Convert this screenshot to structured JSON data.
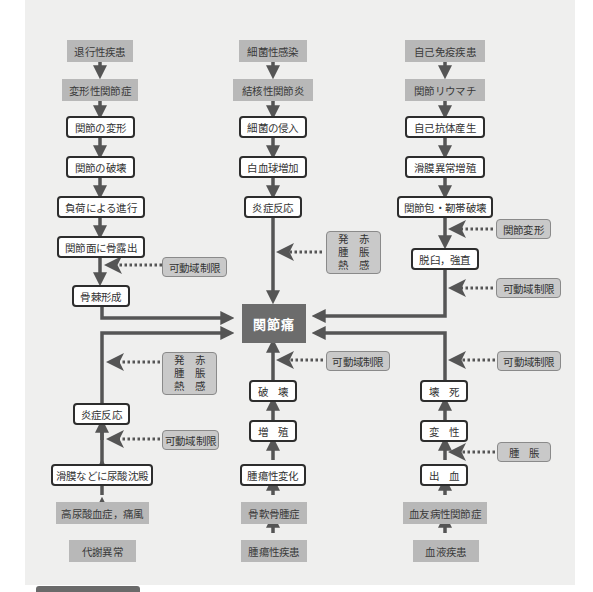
{
  "diagram": {
    "center": "関節痛",
    "columns": {
      "top_left": {
        "source": [
          "退行性疾患",
          "変形性関節症"
        ],
        "steps": [
          "関節の変形",
          "関節の破壊",
          "負荷による進行",
          "関節面に骨露出",
          "骨棘形成"
        ],
        "notes": [
          "可動域制限"
        ]
      },
      "top_center": {
        "source": [
          "細菌性感染",
          "結核性関節炎"
        ],
        "steps": [
          "細菌の侵入",
          "白血球増加",
          "炎症反応"
        ],
        "notes": [
          "発　赤\n腫　脹\n熱　感"
        ]
      },
      "top_right": {
        "source": [
          "自己免疫疾患",
          "関節リウマチ"
        ],
        "steps": [
          "自己抗体産生",
          "滑膜異常増殖",
          "関節包・靭帯破壊",
          "脱臼，強直"
        ],
        "notes": [
          "関節変形",
          "可動域制限"
        ]
      },
      "bottom_left": {
        "source": [
          "代謝異常",
          "高尿酸血症，痛風"
        ],
        "steps": [
          "滑膜などに尿酸沈殿",
          "炎症反応"
        ],
        "notes": [
          "可動域制限",
          "発　赤\n腫　脹\n熱　感"
        ]
      },
      "bottom_center": {
        "source": [
          "腫瘍性疾患",
          "骨軟骨腫症"
        ],
        "steps": [
          "腫瘍性変化",
          "増　殖",
          "破　壊"
        ],
        "notes": [
          "可動域制限"
        ]
      },
      "bottom_right": {
        "source": [
          "血液疾患",
          "血友病性関節症"
        ],
        "steps": [
          "出　血",
          "変　性",
          "壊　死"
        ],
        "notes": [
          "腫　脹",
          "可動域制限"
        ]
      }
    },
    "note_lines": {
      "inflammation": [
        "発　赤",
        "腫　脹",
        "熱　感"
      ]
    },
    "colors": {
      "panel": "#efefee",
      "arrow": "#555555",
      "source_fill": "#b8b8b8",
      "center_fill": "#6c6c6c",
      "note_fill": "#c9c9c9"
    }
  }
}
